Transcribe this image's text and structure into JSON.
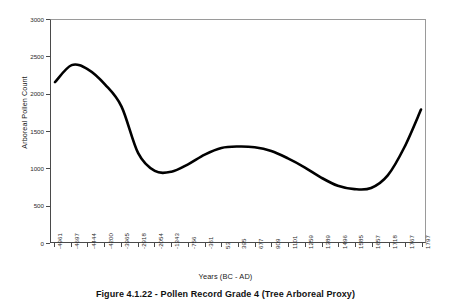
{
  "chart_data": {
    "type": "line",
    "title": "",
    "xlabel": "Years (BC - AD)",
    "ylabel": "Arboreal Pollen Count",
    "ylim": [
      0,
      3000
    ],
    "yticks": [
      0,
      500,
      1000,
      1500,
      2000,
      2500,
      3000
    ],
    "grid": false,
    "legend": null,
    "line_color": "#000000",
    "categories": [
      "-4961",
      "-4697",
      "-4444",
      "-4200",
      "-3965",
      "-2918",
      "-2054",
      "-1343",
      "-756",
      "-361",
      "53",
      "395",
      "677",
      "909",
      "1101",
      "1259",
      "1389",
      "1496",
      "1585",
      "1657",
      "1718",
      "1767",
      "1797"
    ],
    "values": [
      2160,
      2390,
      2330,
      2130,
      1830,
      1200,
      960,
      950,
      1050,
      1180,
      1270,
      1290,
      1280,
      1230,
      1130,
      1010,
      870,
      760,
      715,
      730,
      900,
      1280,
      1790
    ],
    "series": [
      {
        "name": "Arboreal Pollen Count",
        "values": [
          2160,
          2390,
          2330,
          2130,
          1830,
          1200,
          960,
          950,
          1050,
          1180,
          1270,
          1290,
          1280,
          1230,
          1130,
          1010,
          870,
          760,
          715,
          730,
          900,
          1280,
          1790
        ]
      }
    ],
    "annotations": {
      "peak_value": 2390,
      "first_trough_value": 950,
      "mid_hump_value": 1290,
      "second_trough_value": 715,
      "end_value": 1790
    }
  },
  "caption": {
    "text": "Figure 4.1.22 - Pollen Record Grade 4 (Tree Arboreal Proxy)"
  }
}
